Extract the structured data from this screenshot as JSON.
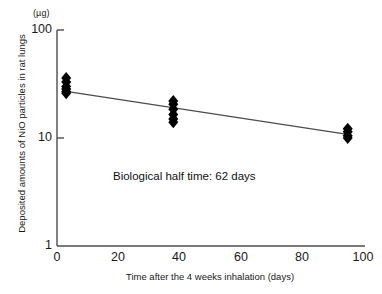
{
  "chart_data": {
    "type": "scatter",
    "title": "",
    "xlabel": "Time after the 4 weeks inhalation (days)",
    "ylabel": "Deposited amounts of NiO particles in rat lungs",
    "yunit": "(µg)",
    "yscale": "log",
    "xlim": [
      0,
      100
    ],
    "ylim": [
      1,
      100
    ],
    "xticks": [
      "0",
      "20",
      "40",
      "60",
      "80",
      "100"
    ],
    "xtick_values": [
      0,
      20,
      40,
      60,
      80,
      100
    ],
    "yticks": [
      "1",
      "10",
      "100"
    ],
    "ytick_values": [
      1,
      10,
      100
    ],
    "grid": false,
    "legend": null,
    "annotations": [
      {
        "text": "Biological half time: 62 days",
        "x": 22,
        "y": 4.2
      }
    ],
    "series": [
      {
        "name": "Deposited NiO",
        "marker": "filled-diamond",
        "color": "#000000",
        "points": [
          {
            "x": 3,
            "y": 36.0
          },
          {
            "x": 3,
            "y": 33.0
          },
          {
            "x": 3,
            "y": 30.0
          },
          {
            "x": 3,
            "y": 28.5
          },
          {
            "x": 3,
            "y": 27.0
          },
          {
            "x": 3,
            "y": 26.0
          },
          {
            "x": 38,
            "y": 22.0
          },
          {
            "x": 38,
            "y": 20.5
          },
          {
            "x": 38,
            "y": 18.5
          },
          {
            "x": 38,
            "y": 16.5
          },
          {
            "x": 38,
            "y": 15.0
          },
          {
            "x": 38,
            "y": 14.0
          },
          {
            "x": 95,
            "y": 12.2
          },
          {
            "x": 95,
            "y": 11.4
          },
          {
            "x": 95,
            "y": 10.5
          },
          {
            "x": 95,
            "y": 10.0
          }
        ]
      }
    ],
    "fit_line": {
      "name": "regression-line",
      "color": "#4d4d4d",
      "x_start": 3,
      "y_start": 27.0,
      "x_end": 96,
      "y_end": 10.7
    }
  }
}
